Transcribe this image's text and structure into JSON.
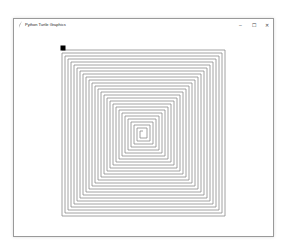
{
  "window": {
    "title": "Python Turtle Graphics",
    "icon": "feather-icon",
    "controls": {
      "minimize": "–",
      "maximize": "☐",
      "close": "✕"
    }
  },
  "canvas": {
    "background": "#ffffff",
    "spiral": {
      "shape": "square-spiral",
      "line_color": "#8c8c8c",
      "line_width": 0.8,
      "center": [
        145,
        132
      ],
      "step": 3,
      "segments": 110,
      "outer_box": {
        "left": 62,
        "top": 50,
        "right": 225,
        "bottom": 216
      }
    },
    "turtle": {
      "shape": "square",
      "color": "#000000",
      "x": 63,
      "y": 48,
      "size": 5
    }
  }
}
